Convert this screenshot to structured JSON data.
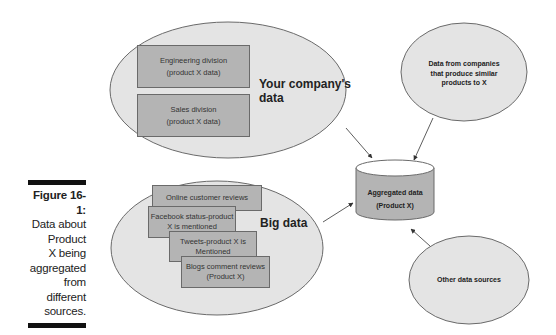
{
  "caption": {
    "figure_label": "Figure 16-1:",
    "text_lines": [
      "Data about",
      "Product",
      "X being",
      "aggregated",
      "from",
      "different",
      "sources."
    ]
  },
  "company_data": {
    "title": "Your company's data",
    "title_lines": [
      "Your company's",
      "data"
    ],
    "boxes": [
      {
        "line1": "Engineering division",
        "line2": "(product X data)"
      },
      {
        "line1": "Sales division",
        "line2": "(product X data)"
      }
    ]
  },
  "big_data": {
    "title": "Big data",
    "boxes": [
      {
        "line1": "Online customer reviews",
        "line2": ""
      },
      {
        "line1": "Facebook status-product",
        "line2": "X is mentioned"
      },
      {
        "line1": "Tweets-product X is",
        "line2": "Mentioned"
      },
      {
        "line1": "Blogs comment reviews",
        "line2": "(Product X)"
      }
    ]
  },
  "similar_companies": {
    "lines": [
      "Data from companies",
      "that produce similar",
      "products to X"
    ]
  },
  "aggregated": {
    "line1": "Aggregated data",
    "line2": "(Product X)"
  },
  "other_sources": {
    "label": "Other data sources"
  },
  "colors": {
    "ellipse_fill": "#e4e4e4",
    "box_fill": "#b4b4b4",
    "outline": "#6a6a6a",
    "text": "#222222"
  }
}
